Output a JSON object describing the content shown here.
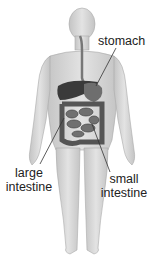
{
  "diagram": {
    "labels": [
      {
        "id": "stomach",
        "text": "stomach"
      },
      {
        "id": "large_intestine",
        "line1": "large",
        "line2": "intestine"
      },
      {
        "id": "small_intestine",
        "line1": "small",
        "line2": "intestine"
      }
    ],
    "colors": {
      "body_fill": "#d9d9d9",
      "body_shade": "#bdbdbd",
      "liver": "#3a3a3a",
      "stomach": "#6e6e6e",
      "intestine": "#555555",
      "leader_line": "#333333",
      "text": "#222222"
    }
  }
}
